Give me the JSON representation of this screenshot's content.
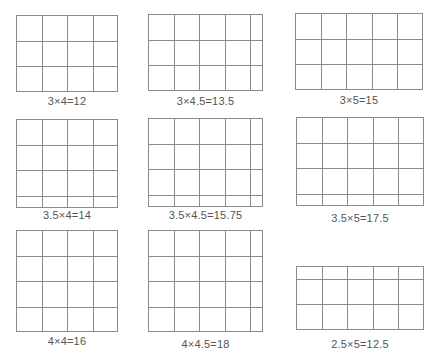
{
  "cell_px": 25.5,
  "line_color": "#8a8a8a",
  "text_color": "#555555",
  "panels": [
    {
      "id": "g1",
      "rows": 3,
      "cols": 4,
      "half_row_at": "none",
      "x": 16,
      "y": 15,
      "label": "3×4=12",
      "label_y": 95
    },
    {
      "id": "g2",
      "rows": 3,
      "cols": 4.5,
      "half_row_at": "none",
      "x": 148,
      "y": 14,
      "label": "3×4.5=13.5",
      "label_y": 95
    },
    {
      "id": "g3",
      "rows": 3,
      "cols": 5,
      "half_row_at": "none",
      "x": 295,
      "y": 13,
      "label": "3×5=15",
      "label_y": 94
    },
    {
      "id": "g4",
      "rows": 3.5,
      "cols": 4,
      "half_row_at": "bottom",
      "x": 16,
      "y": 119,
      "label": "3.5×4=14",
      "label_y": 209
    },
    {
      "id": "g5",
      "rows": 3.5,
      "cols": 4.5,
      "half_row_at": "bottom",
      "x": 148,
      "y": 118,
      "label": "3.5×4.5=15.75",
      "label_y": 209
    },
    {
      "id": "g6",
      "rows": 3.5,
      "cols": 5,
      "half_row_at": "bottom",
      "x": 296,
      "y": 117,
      "label": "3.5×5=17.5",
      "label_y": 212
    },
    {
      "id": "g7",
      "rows": 4,
      "cols": 4,
      "half_row_at": "none",
      "x": 16,
      "y": 230,
      "label": "4×4=16",
      "label_y": 335
    },
    {
      "id": "g8",
      "rows": 4,
      "cols": 4.5,
      "half_row_at": "none",
      "x": 148,
      "y": 230,
      "label": "4×4.5=18",
      "label_y": 338
    },
    {
      "id": "g9",
      "rows": 2.5,
      "cols": 5,
      "half_row_at": "top",
      "x": 296,
      "y": 266,
      "label": "2.5×5=12.5",
      "label_y": 338
    }
  ]
}
